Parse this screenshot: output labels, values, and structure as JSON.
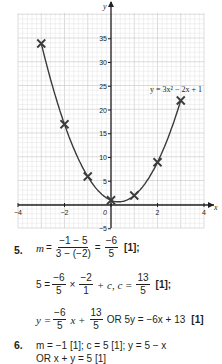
{
  "chart_data": {
    "type": "line",
    "title": "",
    "equation_label": "y = 3x² − 2x + 1",
    "xlabel": "x",
    "ylabel": "y",
    "xlim": [
      -4,
      4
    ],
    "ylim": [
      -5,
      40
    ],
    "grid": true,
    "x_ticks": [
      "-4",
      "-2",
      "0",
      "2",
      "4"
    ],
    "y_ticks": [
      "-5",
      "5",
      "10",
      "15",
      "20",
      "25",
      "30",
      "35"
    ],
    "series": [
      {
        "name": "y = 3x² − 2x + 1",
        "x": [
          -3,
          -2,
          -1,
          0,
          1,
          2,
          3
        ],
        "y": [
          34,
          17,
          6,
          1,
          2,
          9,
          22
        ],
        "marker": "x"
      }
    ]
  },
  "answers": {
    "q5": {
      "number": "5.",
      "line1": {
        "lhs": "m",
        "eq": "=",
        "num1": "−1 − 5",
        "den1": "3 − (−2)",
        "eq2": "=",
        "num2": "−6",
        "den2": "5",
        "mark": "[1];"
      },
      "line2": {
        "lhs": "5 =",
        "num1": "−6",
        "den1": "5",
        "times": "×",
        "num2": "−2",
        "den2": "1",
        "plus": "+ c, c =",
        "num3": "13",
        "den3": "5",
        "mark": "[1];"
      },
      "line3": {
        "lhs": "y =",
        "num1": "−6",
        "den1": "5",
        "mid": "x +",
        "num2": "13",
        "den2": "5",
        "alt": "OR 5y = −6x + 13",
        "mark": "[1]"
      }
    },
    "q6": {
      "number": "6.",
      "line1": "m = −1 [1]; c = 5 [1]; y = 5 − x",
      "line2": "OR x + y = 5 [1]"
    }
  },
  "colors": {
    "ink": "#231f20",
    "grid_major": "#b9b9b9",
    "grid_minor": "#e2e2e2",
    "curve": "#3a3a3a"
  }
}
